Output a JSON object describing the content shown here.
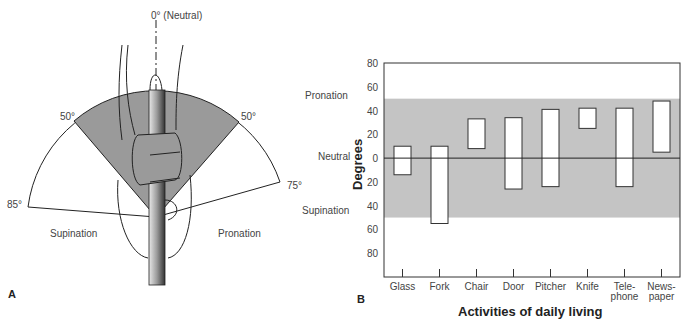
{
  "panel_a": {
    "label": "A",
    "neutral_label": "0° (Neutral)",
    "angle_left_inner": "50°",
    "angle_right_inner": "50°",
    "angle_left_outer": "85°",
    "angle_right_outer": "75°",
    "left_region": "Supination",
    "right_region": "Pronation"
  },
  "panel_b": {
    "label": "B",
    "side_labels": {
      "top": "Pronation",
      "middle": "Neutral",
      "bottom": "Supination"
    }
  },
  "chart_data": {
    "type": "bar",
    "subtype": "floating-range",
    "title": "",
    "xlabel": "Activities of daily living",
    "ylabel": "Degrees",
    "categories": [
      "Glass",
      "Fork",
      "Chair",
      "Door",
      "Pitcher",
      "Knife",
      "Tele-\nphone",
      "News-\npaper"
    ],
    "category_lines": [
      [
        "Glass"
      ],
      [
        "Fork"
      ],
      [
        "Chair"
      ],
      [
        "Door"
      ],
      [
        "Pitcher"
      ],
      [
        "Knife"
      ],
      [
        "Tele-",
        "phone"
      ],
      [
        "News-",
        "paper"
      ]
    ],
    "series": [
      {
        "name": "Range (pronation +, supination -)",
        "low": [
          -14,
          -55,
          8,
          -26,
          -24,
          25,
          -24,
          5
        ],
        "high": [
          10,
          10,
          33,
          34,
          41,
          42,
          42,
          48
        ]
      }
    ],
    "y_ticks": [
      80,
      60,
      40,
      20,
      0,
      20,
      40,
      60,
      80
    ],
    "y_tick_values": [
      80,
      60,
      40,
      20,
      0,
      -20,
      -40,
      -60,
      -80
    ],
    "ylim": [
      -100,
      80
    ],
    "shaded_band": {
      "from": -50,
      "to": 50,
      "color": "#c4c4c4"
    },
    "zero_line": true,
    "grid": false
  }
}
